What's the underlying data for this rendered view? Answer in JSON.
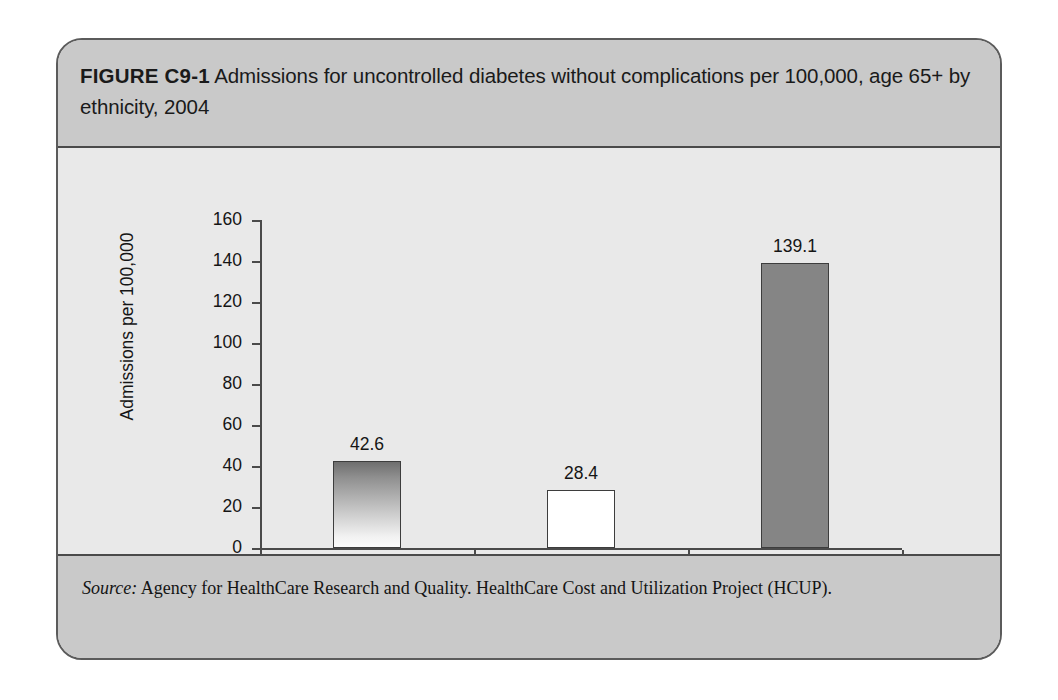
{
  "figure": {
    "label": "FIGURE C9-1",
    "caption": "Admissions for uncontrolled diabetes without complications per 100,000, age 65+ by ethnicity, 2004",
    "source_lead": "Source:",
    "source_text": " Agency for HealthCare Research and Quality. HealthCare Cost and Utilization Project (HCUP).",
    "colors": {
      "frame_border": "#5b5b5b",
      "band_background": "#c9c9c9",
      "panel_background": "#e9e9e9",
      "axis": "#4a4a4a",
      "bar_gray": "#858585",
      "bar_white": "#ffffff",
      "bar_gradient_top": "#6e6e6e",
      "bar_gradient_bottom": "#fbfbfb"
    }
  },
  "chart_data": {
    "type": "bar",
    "title": "Admissions for uncontrolled diabetes without complications per 100,000, age 65+ by ethnicity, 2004",
    "xlabel": "",
    "ylabel": "Admissions per 100,000",
    "categories": [
      "Total",
      "White",
      "Hispanic"
    ],
    "values": [
      42.6,
      28.4,
      139.1
    ],
    "value_labels": [
      "42.6",
      "28.4",
      "139.1"
    ],
    "bar_styles": [
      "gradient-dark-to-light",
      "white",
      "solid-gray"
    ],
    "ylim": [
      0,
      160
    ],
    "ytick_values": [
      0,
      20,
      40,
      60,
      80,
      100,
      120,
      140,
      160
    ],
    "ytick_labels": [
      "0",
      "20",
      "40",
      "60",
      "80",
      "100",
      "120",
      "140",
      "160"
    ],
    "grid": false,
    "legend": "none"
  }
}
